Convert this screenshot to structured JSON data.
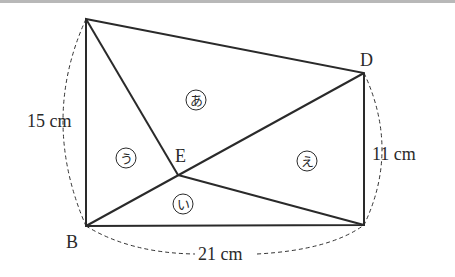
{
  "diagram": {
    "title": "",
    "points": {
      "A": {
        "label": "",
        "x": 86,
        "y": 19
      },
      "B": {
        "label": "B",
        "x": 86,
        "y": 226
      },
      "C": {
        "label": "",
        "x": 364,
        "y": 225
      },
      "D": {
        "label": "D",
        "x": 364,
        "y": 73
      },
      "E": {
        "label": "E",
        "x": 178,
        "y": 175
      }
    },
    "regions": [
      {
        "id": "a",
        "label": "あ"
      },
      {
        "id": "i",
        "label": "い"
      },
      {
        "id": "u",
        "label": "う"
      },
      {
        "id": "e",
        "label": "え"
      }
    ],
    "measurements": {
      "left": "15 cm",
      "right": "11 cm",
      "bottom": "21 cm"
    },
    "colors": {
      "line": "#2a2a2a",
      "top_rule": "#b8b8b8"
    }
  }
}
